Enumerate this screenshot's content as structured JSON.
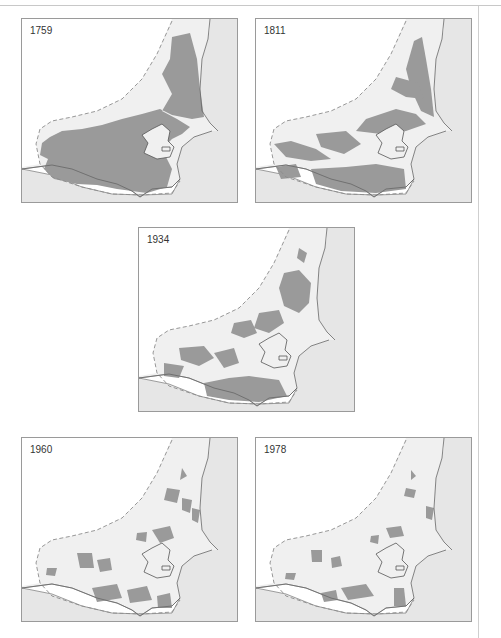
{
  "figure": {
    "colors": {
      "forest": "#9a9a9a",
      "land": "#f0f0f0",
      "sea": "#e6e6e6",
      "background": "#ffffff",
      "frame": "#9a9a9a"
    },
    "panels": [
      {
        "year": "1759",
        "forest_extent": "extensive",
        "patches": [
          "M150,18 L168,14 L175,40 L178,70 L182,98 L170,100 L150,96 L138,90 L120,95 L100,100 L80,106 L60,110 L40,112 L28,118 L20,124 L18,136 L26,140 L22,150 L32,160 L55,165 L75,166 L95,170 L125,174 L145,168 L150,150 L140,130 L150,120 L160,115 L168,108 L155,100 L140,92 L150,75 L140,55 L148,40 Z"
        ]
      },
      {
        "year": "1811",
        "forest_extent": "large",
        "patches": [
          "M158,22 L166,18 L170,40 L175,70 L178,98 L165,92 L155,70 L150,50 Z",
          "M140,58 L162,64 L168,80 L150,78 L135,70 Z",
          "M110,100 L140,90 L160,95 L170,105 L150,112 L125,115 L100,112 Z",
          "M18,125 L35,122 L60,130 L75,140 L55,142 L30,138 Z",
          "M60,115 L90,112 L105,125 L88,135 L65,128 Z",
          "M55,150 L90,148 L120,145 L148,150 L150,170 L120,174 L85,172 L60,165 Z",
          "M20,148 L40,145 L45,158 L25,160 Z"
        ]
      },
      {
        "year": "1934",
        "forest_extent": "moderate",
        "patches": [
          "M160,20 L168,25 L165,35 L158,30 Z",
          "M145,45 L160,42 L172,55 L170,75 L160,85 L145,78 L140,60 Z",
          "M120,85 L140,82 L145,95 L130,105 L115,100 Z",
          "M95,95 L112,92 L118,105 L105,110 L92,105 Z",
          "M40,120 L65,118 L75,130 L60,138 L42,132 Z",
          "M75,125 L95,120 L100,135 L85,140 Z",
          "M25,135 L45,138 L40,150 L25,148 Z",
          "M65,155 L90,150 L110,148 L140,152 L148,168 L120,174 L90,172 L68,168 Z"
        ]
      },
      {
        "year": "1960",
        "forest_extent": "sparse",
        "patches": [
          "M160,30 L165,38 L158,42 Z",
          "M145,50 L158,52 L155,65 L142,62 Z",
          "M160,60 L170,62 L168,75 L160,72 Z",
          "M170,70 L178,72 L176,85 L170,82 Z",
          "M130,92 L148,88 L152,100 L138,105 Z",
          "M115,95 L125,94 L124,104 L114,102 Z",
          "M55,115 L70,115 L72,130 L58,130 Z",
          "M75,122 L88,120 L90,132 L78,134 Z",
          "M70,150 L95,146 L100,160 L75,164 Z",
          "M105,152 L125,148 L130,162 L108,165 Z",
          "M135,158 L148,155 L150,170 L136,170 Z",
          "M25,130 L35,130 L33,138 L24,137 Z"
        ]
      },
      {
        "year": "1978",
        "forest_extent": "very sparse",
        "patches": [
          "M155,32 L160,38 L155,42 Z",
          "M150,50 L160,52 L158,60 L148,58 Z",
          "M170,68 L178,70 L176,82 L170,80 Z",
          "M130,90 L145,88 L148,98 L134,100 Z",
          "M115,98 L123,97 L122,106 L114,104 Z",
          "M55,112 L66,112 L66,124 L56,124 Z",
          "M75,120 L84,118 L86,128 L76,130 Z",
          "M85,150 L110,146 L118,158 L92,162 Z",
          "M65,155 L80,152 L82,162 L68,164 Z",
          "M138,150 L148,150 L150,168 L138,168 Z",
          "M30,135 L40,135 L38,142 L29,141 Z"
        ]
      }
    ]
  }
}
